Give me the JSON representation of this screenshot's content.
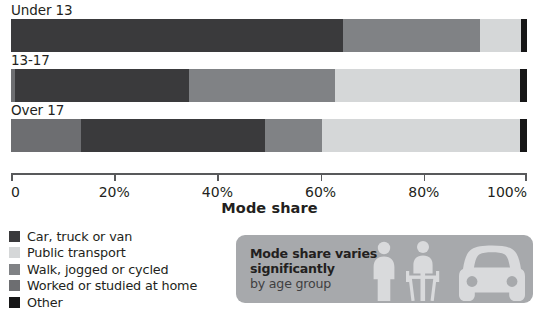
{
  "chart_data": {
    "type": "bar",
    "orientation": "horizontal",
    "stacked": true,
    "normalized": true,
    "title": "",
    "xlabel": "Mode share",
    "ylabel": "",
    "xlim": [
      0,
      100
    ],
    "xtick_labels": [
      "0",
      "20%",
      "40%",
      "60%",
      "80%",
      "100%"
    ],
    "xtick_values": [
      0,
      20,
      40,
      60,
      80,
      100
    ],
    "grid": false,
    "legend_position": "bottom-left",
    "categories": [
      "Under 13",
      "13-17",
      "Over 17"
    ],
    "series": [
      {
        "name": "Worked or studied at home",
        "color": "#6d6e71",
        "values": [
          0.0,
          0.8,
          13.6
        ]
      },
      {
        "name": "Car, truck or van",
        "color": "#3a3a3c",
        "values": [
          64.3,
          33.7,
          35.6
        ]
      },
      {
        "name": "Walk, jogged or cycled",
        "color": "#808285",
        "values": [
          26.6,
          28.3,
          11.1
        ]
      },
      {
        "name": "Public transport",
        "color": "#d5d7d8",
        "values": [
          7.9,
          35.9,
          38.4
        ]
      },
      {
        "name": "Other",
        "color": "#161617",
        "values": [
          1.2,
          1.3,
          1.3
        ]
      }
    ]
  },
  "axis": {
    "x_title": "Mode share",
    "ticks": [
      {
        "label": "0",
        "value": 0
      },
      {
        "label": "20%",
        "value": 20
      },
      {
        "label": "40%",
        "value": 40
      },
      {
        "label": "60%",
        "value": 60
      },
      {
        "label": "80%",
        "value": 80
      },
      {
        "label": "100%",
        "value": 100
      }
    ]
  },
  "bars": [
    {
      "label": "Under 13",
      "segments": [
        {
          "name": "Car, truck or van",
          "value": 64.3,
          "color": "#3a3a3c"
        },
        {
          "name": "Walk, jogged or cycled",
          "value": 26.6,
          "color": "#808285"
        },
        {
          "name": "Public transport",
          "value": 7.9,
          "color": "#d5d7d8"
        },
        {
          "name": "Other",
          "value": 1.2,
          "color": "#161617"
        }
      ]
    },
    {
      "label": "13-17",
      "segments": [
        {
          "name": "Worked or studied at home",
          "value": 0.8,
          "color": "#6d6e71"
        },
        {
          "name": "Car, truck or van",
          "value": 33.7,
          "color": "#3a3a3c"
        },
        {
          "name": "Walk, jogged or cycled",
          "value": 28.3,
          "color": "#808285"
        },
        {
          "name": "Public transport",
          "value": 35.9,
          "color": "#d5d7d8"
        },
        {
          "name": "Other",
          "value": 1.3,
          "color": "#161617"
        }
      ]
    },
    {
      "label": "Over 17",
      "segments": [
        {
          "name": "Worked or studied at home",
          "value": 13.6,
          "color": "#6d6e71"
        },
        {
          "name": "Car, truck or van",
          "value": 35.6,
          "color": "#3a3a3c"
        },
        {
          "name": "Walk, jogged or cycled",
          "value": 11.1,
          "color": "#808285"
        },
        {
          "name": "Public transport",
          "value": 38.4,
          "color": "#d5d7d8"
        },
        {
          "name": "Other",
          "value": 1.3,
          "color": "#161617"
        }
      ]
    }
  ],
  "legend": {
    "items": [
      {
        "label": "Car, truck or van",
        "color": "#3a3a3c"
      },
      {
        "label": "Public transport",
        "color": "#d5d7d8"
      },
      {
        "label": "Walk, jogged or cycled",
        "color": "#808285"
      },
      {
        "label": "Worked or studied at home",
        "color": "#6d6e71"
      },
      {
        "label": "Other",
        "color": "#161617"
      }
    ]
  },
  "callout": {
    "background": "#a7a9ac",
    "line1": "Mode share varies",
    "line2": "significantly",
    "line3": "by age group",
    "icons": [
      "pedestrian-icon",
      "cyclist-icon",
      "car-front-icon"
    ]
  }
}
